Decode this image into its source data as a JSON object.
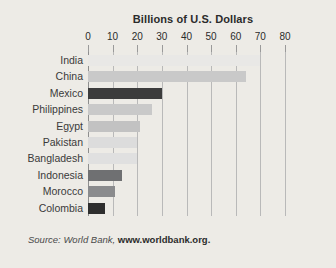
{
  "chart_data": {
    "type": "bar",
    "orientation": "horizontal",
    "title": "Billions of U.S. Dollars",
    "xlabel": "",
    "ylabel": "",
    "xlim": [
      0,
      80
    ],
    "xticks": [
      0,
      10,
      20,
      30,
      40,
      50,
      60,
      70,
      80
    ],
    "xtick_labels": [
      "0",
      "10",
      "20",
      "30",
      "40",
      "50",
      "60",
      "70",
      "80"
    ],
    "grid": true,
    "legend": "none",
    "categories": [
      "India",
      "China",
      "Mexico",
      "Philippines",
      "Egypt",
      "Pakistan",
      "Bangladesh",
      "Indonesia",
      "Morocco",
      "Colombia"
    ],
    "values": [
      70,
      64,
      30,
      26,
      21,
      20,
      20,
      14,
      11,
      7
    ],
    "bar_colors": [
      "#e9e8e6",
      "#c9c9c9",
      "#3c3c3c",
      "#c9c9c9",
      "#c2c2c2",
      "#dcdcdc",
      "#e0e0e0",
      "#6f7072",
      "#8a8b8d",
      "#2e2e2e"
    ],
    "bars": [
      {
        "label": "India",
        "value": 70,
        "color": "#e9e8e6"
      },
      {
        "label": "China",
        "value": 64,
        "color": "#c9c9c9"
      },
      {
        "label": "Mexico",
        "value": 30,
        "color": "#3c3c3c"
      },
      {
        "label": "Philippines",
        "value": 26,
        "color": "#c9c9c9"
      },
      {
        "label": "Egypt",
        "value": 21,
        "color": "#c2c2c2"
      },
      {
        "label": "Pakistan",
        "value": 20,
        "color": "#dcdcdc"
      },
      {
        "label": "Bangladesh",
        "value": 20,
        "color": "#e0e0e0"
      },
      {
        "label": "Indonesia",
        "value": 14,
        "color": "#6f7072"
      },
      {
        "label": "Morocco",
        "value": 11,
        "color": "#8a8b8d"
      },
      {
        "label": "Colombia",
        "value": 7,
        "color": "#2e2e2e"
      }
    ]
  },
  "source": {
    "prefix": "Source: World Bank, ",
    "url": "www.worldbank.org."
  },
  "colors": {
    "background": "#edebe6",
    "gridline": "#b9b9b9",
    "axis": "#8e8e8e",
    "text": "#2b2b2b"
  }
}
